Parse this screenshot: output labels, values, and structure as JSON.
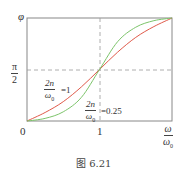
{
  "chart_data": {
    "type": "line",
    "title": "",
    "caption": "图 6.21",
    "xlabel": "ω/ω₀",
    "ylabel": "φ",
    "x_ticks": [
      {
        "value": 0,
        "label": "0"
      },
      {
        "value": 1,
        "label": "1"
      }
    ],
    "y_ticks": [
      {
        "value": 1.5708,
        "label": "π/2"
      }
    ],
    "xlim": [
      0,
      2
    ],
    "ylim": [
      0,
      3.1416
    ],
    "grid": false,
    "reference_lines": [
      {
        "orientation": "vertical",
        "at": 1,
        "style": "dashed"
      },
      {
        "orientation": "horizontal",
        "at": 1.5708,
        "style": "dashed"
      }
    ],
    "series": [
      {
        "name": "2n/ω₀ = 1",
        "color": "#e05a4a",
        "x": [
          0,
          0.25,
          0.5,
          0.75,
          1.0,
          1.25,
          1.5,
          1.75,
          2.0
        ],
        "y": [
          0,
          0.26,
          0.59,
          1.04,
          1.57,
          2.1,
          2.55,
          2.88,
          3.14
        ]
      },
      {
        "name": "2n/ω₀ = 0.25",
        "color": "#7cc46a",
        "x": [
          0,
          0.25,
          0.5,
          0.75,
          1.0,
          1.25,
          1.5,
          1.75,
          2.0
        ],
        "y": [
          0,
          0.08,
          0.28,
          0.72,
          1.57,
          2.42,
          2.86,
          3.06,
          3.14
        ]
      }
    ],
    "annotations": [
      {
        "text": "2n/ω₀ = 1",
        "target_series": 0
      },
      {
        "text": "2n/ω₀ = 0.25",
        "target_series": 1
      }
    ]
  },
  "labels": {
    "y_axis": "φ",
    "y_tick_num": "π",
    "y_tick_den": "2",
    "x_origin": "0",
    "x_tick_1": "1",
    "x_axis_num": "ω",
    "x_axis_den": "ω",
    "x_axis_den_sub": "0",
    "ann1_num": "2n",
    "ann1_den": "ω",
    "ann1_den_sub": "0",
    "ann1_value": "=1",
    "ann2_num": "2n",
    "ann2_den": "ω",
    "ann2_den_sub": "0",
    "ann2_value": "=0.25",
    "caption": "图 6.21"
  }
}
